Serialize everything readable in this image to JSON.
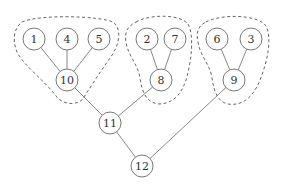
{
  "diagram": {
    "type": "tree",
    "node_radius": 11,
    "nodes": [
      {
        "id": "1",
        "label": "1",
        "x": 34,
        "y": 39
      },
      {
        "id": "4",
        "label": "4",
        "x": 67,
        "y": 39
      },
      {
        "id": "5",
        "label": "5",
        "x": 99,
        "y": 39
      },
      {
        "id": "10",
        "label": "10",
        "x": 67,
        "y": 80
      },
      {
        "id": "2",
        "label": "2",
        "x": 147,
        "y": 39
      },
      {
        "id": "7",
        "label": "7",
        "x": 175,
        "y": 39
      },
      {
        "id": "8",
        "label": "8",
        "x": 161,
        "y": 80
      },
      {
        "id": "6",
        "label": "6",
        "x": 217,
        "y": 39
      },
      {
        "id": "3",
        "label": "3",
        "x": 251,
        "y": 39
      },
      {
        "id": "9",
        "label": "9",
        "x": 234,
        "y": 80
      },
      {
        "id": "11",
        "label": "11",
        "x": 110,
        "y": 123
      },
      {
        "id": "12",
        "label": "12",
        "x": 142,
        "y": 166
      }
    ],
    "edges": [
      {
        "from": "1",
        "to": "10"
      },
      {
        "from": "4",
        "to": "10"
      },
      {
        "from": "5",
        "to": "10"
      },
      {
        "from": "2",
        "to": "8"
      },
      {
        "from": "7",
        "to": "8"
      },
      {
        "from": "6",
        "to": "9"
      },
      {
        "from": "3",
        "to": "9"
      },
      {
        "from": "10",
        "to": "11"
      },
      {
        "from": "8",
        "to": "11"
      },
      {
        "from": "11",
        "to": "12"
      },
      {
        "from": "9",
        "to": "12"
      }
    ],
    "groups": [
      {
        "name": "group-1-4-5-10",
        "members": [
          "1",
          "4",
          "5",
          "10"
        ],
        "path": "M 22 22 C 40 14, 100 16, 113 22 C 122 28, 120 45, 110 58 C 100 72, 90 88, 82 100 C 74 106, 62 104, 56 96 C 44 80, 24 66, 17 52 C 12 40, 14 28, 22 22 Z"
      },
      {
        "name": "group-2-7-8",
        "members": [
          "2",
          "7",
          "8"
        ],
        "path": "M 136 22 C 150 14, 180 14, 188 24 C 194 34, 192 60, 186 80 C 180 98, 170 104, 158 104 C 146 102, 142 92, 140 78 C 138 64, 128 56, 126 42 C 124 32, 128 26, 136 22 Z"
      },
      {
        "name": "group-6-3-9",
        "members": [
          "6",
          "3",
          "9"
        ],
        "path": "M 206 22 C 220 14, 258 14, 266 26 C 272 38, 268 60, 260 80 C 252 100, 240 106, 228 104 C 218 102, 214 92, 212 78 C 210 64, 200 56, 198 42 C 196 32, 198 26, 206 22 Z"
      }
    ]
  }
}
